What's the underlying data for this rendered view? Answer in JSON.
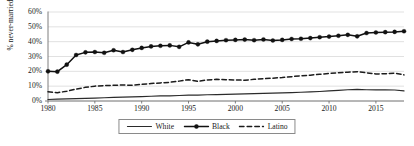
{
  "chart_data": {
    "type": "line",
    "title": "",
    "subtitle": "",
    "xlabel": "",
    "ylabel": "% never-married",
    "xlim": [
      1980,
      2018
    ],
    "ylim": [
      0,
      60
    ],
    "grid": true,
    "grid_axis": "y",
    "legend_position": "bottom-center",
    "y_ticks": [
      "0%",
      "10%",
      "20%",
      "30%",
      "40%",
      "50%",
      "60%"
    ],
    "y_tick_values": [
      0,
      10,
      20,
      30,
      40,
      50,
      60
    ],
    "x_ticks": [
      "1980",
      "1985",
      "1990",
      "1995",
      "2000",
      "2005",
      "2010",
      "2015"
    ],
    "x_tick_values": [
      1980,
      1985,
      1990,
      1995,
      2000,
      2005,
      2010,
      2015
    ],
    "x": [
      1980,
      1981,
      1982,
      1983,
      1984,
      1985,
      1986,
      1987,
      1988,
      1989,
      1990,
      1991,
      1992,
      1993,
      1994,
      1995,
      1996,
      1997,
      1998,
      1999,
      2000,
      2001,
      2002,
      2003,
      2004,
      2005,
      2006,
      2007,
      2008,
      2009,
      2010,
      2011,
      2012,
      2013,
      2014,
      2015,
      2016,
      2017,
      2018
    ],
    "series": [
      {
        "name": "White",
        "style": "solid",
        "marker": "none",
        "color": "#2b2b2b",
        "values": [
          1.0,
          1.2,
          1.4,
          1.6,
          1.8,
          2.0,
          2.2,
          2.4,
          2.6,
          2.8,
          3.0,
          3.2,
          3.4,
          3.5,
          3.7,
          3.9,
          4.0,
          4.2,
          4.3,
          4.5,
          4.6,
          4.8,
          5.0,
          5.1,
          5.3,
          5.5,
          5.7,
          5.9,
          6.1,
          6.4,
          6.8,
          7.2,
          7.6,
          7.8,
          7.6,
          7.5,
          7.6,
          7.4,
          6.8
        ]
      },
      {
        "name": "Black",
        "style": "solid",
        "marker": "circle",
        "color": "#111111",
        "values": [
          20.0,
          19.8,
          24.5,
          31.0,
          32.8,
          33.0,
          32.5,
          34.2,
          33.0,
          34.5,
          35.8,
          36.8,
          37.2,
          37.5,
          36.5,
          39.5,
          38.2,
          40.0,
          40.5,
          41.0,
          41.2,
          41.4,
          41.0,
          41.5,
          40.8,
          41.2,
          41.8,
          42.0,
          42.4,
          43.0,
          43.4,
          44.0,
          44.6,
          43.6,
          45.8,
          46.2,
          46.4,
          46.6,
          47.0
        ]
      },
      {
        "name": "Latino",
        "style": "dashed",
        "marker": "none",
        "color": "#1c1c1c",
        "values": [
          6.2,
          5.6,
          6.6,
          8.0,
          9.2,
          10.0,
          10.4,
          10.6,
          10.8,
          10.6,
          11.2,
          11.8,
          12.2,
          12.6,
          13.4,
          14.4,
          13.2,
          14.2,
          14.6,
          14.4,
          14.2,
          14.0,
          14.6,
          15.0,
          15.4,
          15.8,
          16.4,
          17.0,
          17.4,
          18.0,
          18.6,
          19.0,
          19.4,
          19.8,
          19.0,
          18.2,
          18.4,
          18.8,
          17.6
        ]
      }
    ]
  },
  "legend": {
    "items": [
      {
        "label": "White",
        "key": "solid-line-key"
      },
      {
        "label": "Black",
        "key": "solid-line-marker-key"
      },
      {
        "label": "Latino",
        "key": "dashed-line-key"
      }
    ]
  }
}
